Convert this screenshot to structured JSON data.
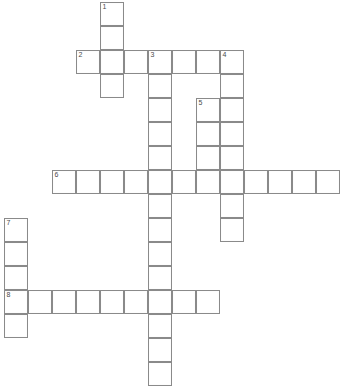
{
  "puzzle": {
    "title": "Crossword Grid",
    "grid": {
      "cell_size": 24,
      "origin_x": 4,
      "origin_y": 2,
      "columns": 12,
      "rows": 16,
      "cell_fill": "#ffffff",
      "cell_border": "#8a8a8a",
      "background": "#ffffff",
      "number_color": "#4a4a4a"
    },
    "entries": [
      {
        "number": "1",
        "direction": "down",
        "col": 4,
        "row": 0,
        "length": 4,
        "label": "1 Down"
      },
      {
        "number": "2",
        "direction": "across",
        "col": 3,
        "row": 2,
        "length": 6,
        "label": "2 Across"
      },
      {
        "number": "3",
        "direction": "down",
        "col": 6,
        "row": 2,
        "length": 13,
        "label": "3 Down"
      },
      {
        "number": "4",
        "direction": "down",
        "col": 9,
        "row": 2,
        "length": 8,
        "label": "4 Down"
      },
      {
        "number": "5",
        "direction": "down",
        "col": 8,
        "row": 4,
        "length": 4,
        "label": "5 Down"
      },
      {
        "number": "6",
        "direction": "across",
        "col": 2,
        "row": 7,
        "length": 12,
        "label": "6 Across"
      },
      {
        "number": "7",
        "direction": "down",
        "col": 0,
        "row": 9,
        "length": 5,
        "label": "7 Down"
      },
      {
        "number": "8",
        "direction": "across",
        "col": 0,
        "row": 12,
        "length": 11,
        "label": "8 Across"
      }
    ],
    "cells": [
      {
        "col": 4,
        "row": 0,
        "number": "1",
        "letter": ""
      },
      {
        "col": 4,
        "row": 1,
        "number": "",
        "letter": ""
      },
      {
        "col": 3,
        "row": 2,
        "number": "2",
        "letter": ""
      },
      {
        "col": 4,
        "row": 2,
        "number": "",
        "letter": ""
      },
      {
        "col": 5,
        "row": 2,
        "number": "",
        "letter": ""
      },
      {
        "col": 6,
        "row": 2,
        "number": "3",
        "letter": ""
      },
      {
        "col": 7,
        "row": 2,
        "number": "",
        "letter": ""
      },
      {
        "col": 8,
        "row": 2,
        "number": "",
        "letter": ""
      },
      {
        "col": 9,
        "row": 2,
        "number": "4",
        "letter": ""
      },
      {
        "col": 4,
        "row": 3,
        "number": "",
        "letter": ""
      },
      {
        "col": 6,
        "row": 3,
        "number": "",
        "letter": ""
      },
      {
        "col": 9,
        "row": 3,
        "number": "",
        "letter": ""
      },
      {
        "col": 6,
        "row": 4,
        "number": "",
        "letter": ""
      },
      {
        "col": 8,
        "row": 4,
        "number": "5",
        "letter": ""
      },
      {
        "col": 9,
        "row": 4,
        "number": "",
        "letter": ""
      },
      {
        "col": 6,
        "row": 5,
        "number": "",
        "letter": ""
      },
      {
        "col": 8,
        "row": 5,
        "number": "",
        "letter": ""
      },
      {
        "col": 9,
        "row": 5,
        "number": "",
        "letter": ""
      },
      {
        "col": 6,
        "row": 6,
        "number": "",
        "letter": ""
      },
      {
        "col": 8,
        "row": 6,
        "number": "",
        "letter": ""
      },
      {
        "col": 9,
        "row": 6,
        "number": "",
        "letter": ""
      },
      {
        "col": 2,
        "row": 7,
        "number": "6",
        "letter": ""
      },
      {
        "col": 3,
        "row": 7,
        "number": "",
        "letter": ""
      },
      {
        "col": 4,
        "row": 7,
        "number": "",
        "letter": ""
      },
      {
        "col": 5,
        "row": 7,
        "number": "",
        "letter": ""
      },
      {
        "col": 6,
        "row": 7,
        "number": "",
        "letter": ""
      },
      {
        "col": 7,
        "row": 7,
        "number": "",
        "letter": ""
      },
      {
        "col": 8,
        "row": 7,
        "number": "",
        "letter": ""
      },
      {
        "col": 9,
        "row": 7,
        "number": "",
        "letter": ""
      },
      {
        "col": 10,
        "row": 7,
        "number": "",
        "letter": ""
      },
      {
        "col": 11,
        "row": 7,
        "number": "",
        "letter": ""
      },
      {
        "col": 12,
        "row": 7,
        "number": "",
        "letter": ""
      },
      {
        "col": 13,
        "row": 7,
        "number": "",
        "letter": ""
      },
      {
        "col": 6,
        "row": 8,
        "number": "",
        "letter": ""
      },
      {
        "col": 9,
        "row": 8,
        "number": "",
        "letter": ""
      },
      {
        "col": 0,
        "row": 9,
        "number": "7",
        "letter": ""
      },
      {
        "col": 6,
        "row": 9,
        "number": "",
        "letter": ""
      },
      {
        "col": 9,
        "row": 9,
        "number": "",
        "letter": ""
      },
      {
        "col": 0,
        "row": 10,
        "number": "",
        "letter": ""
      },
      {
        "col": 6,
        "row": 10,
        "number": "",
        "letter": ""
      },
      {
        "col": 0,
        "row": 11,
        "number": "",
        "letter": ""
      },
      {
        "col": 6,
        "row": 11,
        "number": "",
        "letter": ""
      },
      {
        "col": 0,
        "row": 12,
        "number": "8",
        "letter": ""
      },
      {
        "col": 1,
        "row": 12,
        "number": "",
        "letter": ""
      },
      {
        "col": 2,
        "row": 12,
        "number": "",
        "letter": ""
      },
      {
        "col": 3,
        "row": 12,
        "number": "",
        "letter": ""
      },
      {
        "col": 4,
        "row": 12,
        "number": "",
        "letter": ""
      },
      {
        "col": 5,
        "row": 12,
        "number": "",
        "letter": ""
      },
      {
        "col": 6,
        "row": 12,
        "number": "",
        "letter": ""
      },
      {
        "col": 7,
        "row": 12,
        "number": "",
        "letter": ""
      },
      {
        "col": 8,
        "row": 12,
        "number": "",
        "letter": ""
      },
      {
        "col": 0,
        "row": 13,
        "number": "",
        "letter": ""
      },
      {
        "col": 6,
        "row": 13,
        "number": "",
        "letter": ""
      },
      {
        "col": 6,
        "row": 14,
        "number": "",
        "letter": ""
      },
      {
        "col": 6,
        "row": 15,
        "number": "",
        "letter": ""
      }
    ]
  }
}
